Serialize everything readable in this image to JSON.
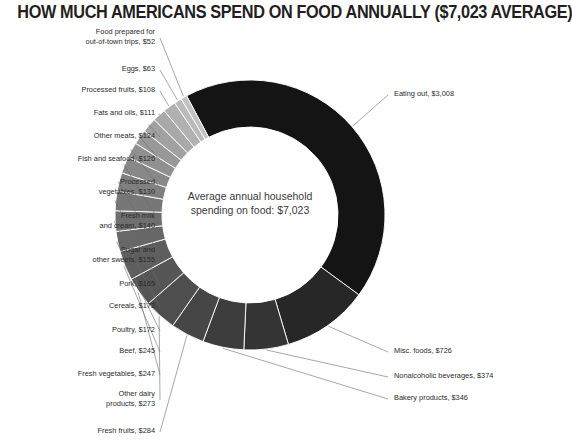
{
  "title": "HOW MUCH AMERICANS SPEND ON FOOD ANNUALLY ($7,023 AVERAGE)",
  "center": {
    "line1": "Average annual household",
    "line2": "spending on food: $7,023"
  },
  "chart_data": {
    "type": "pie",
    "variant": "donut",
    "title": "HOW MUCH AMERICANS SPEND ON FOOD ANNUALLY ($7,023 AVERAGE)",
    "center_label": "Average annual household spending on food: $7,023",
    "total": 7023,
    "currency": "USD",
    "units": "dollars per year",
    "legend": "none (direct labels with leader lines)",
    "start_angle_deg": -118,
    "direction": "clockwise",
    "labels": [
      "Eating out",
      "Misc. foods",
      "Nonalcoholic beverages",
      "Bakery products",
      "Fresh fruits",
      "Other dairy products",
      "Fresh vegetables",
      "Beef",
      "Poultry",
      "Cereals",
      "Pork",
      "Sugar and other sweets",
      "Fresh milk and cream",
      "Processed vegetables",
      "Fish and seafood",
      "Other meats",
      "Fats and oils",
      "Processed fruits",
      "Eggs",
      "Food prepared for out-of-town trips"
    ],
    "values": [
      3008,
      726,
      374,
      346,
      284,
      273,
      247,
      245,
      172,
      172,
      165,
      155,
      140,
      130,
      126,
      124,
      111,
      108,
      63,
      52
    ],
    "value_texts": [
      "$3,008",
      "$726",
      "$374",
      "$346",
      "$284",
      "$273",
      "$247",
      "$245",
      "$172",
      "$172",
      "$165",
      "$155",
      "$140",
      "$130",
      "$126",
      "$124",
      "$111",
      "$108",
      "$63",
      "$52"
    ],
    "colors": [
      "#141414",
      "#272727",
      "#343434",
      "#3d3d3d",
      "#464646",
      "#4e4e4e",
      "#565656",
      "#5e5e5e",
      "#676767",
      "#6f6f6f",
      "#777777",
      "#808080",
      "#888888",
      "#909090",
      "#989898",
      "#a1a1a1",
      "#a9a9a9",
      "#b1b1b1",
      "#bababa",
      "#c2c2c2"
    ]
  },
  "segments": [
    {
      "label": "Eating out, $3,008",
      "name": "eating-out",
      "side": "right",
      "lines": [
        "Eating out, $3,008"
      ]
    },
    {
      "label": "Misc. foods, $726",
      "name": "misc-foods",
      "side": "right",
      "lines": [
        "Misc. foods, $726"
      ]
    },
    {
      "label": "Nonalcoholic beverages, $374",
      "name": "nonalcoholic-beverages",
      "side": "right",
      "lines": [
        "Nonalcoholic beverages, $374"
      ]
    },
    {
      "label": "Bakery products, $346",
      "name": "bakery-products",
      "side": "right",
      "lines": [
        "Bakery products, $346"
      ]
    },
    {
      "label": "Fresh fruits, $284",
      "name": "fresh-fruits",
      "side": "left",
      "lines": [
        "Fresh fruits, $284"
      ]
    },
    {
      "label": "Other dairy products, $273",
      "name": "other-dairy-products",
      "side": "left",
      "lines": [
        "Other dairy",
        "products, $273"
      ]
    },
    {
      "label": "Fresh vegetables, $247",
      "name": "fresh-vegetables",
      "side": "left",
      "lines": [
        "Fresh vegetables, $247"
      ]
    },
    {
      "label": "Beef, $245",
      "name": "beef",
      "side": "left",
      "lines": [
        "Beef, $245"
      ]
    },
    {
      "label": "Poultry, $172",
      "name": "poultry",
      "side": "left",
      "lines": [
        "Poultry, $172"
      ]
    },
    {
      "label": "Cereals, $172",
      "name": "cereals",
      "side": "left",
      "lines": [
        "Cereals, $172"
      ]
    },
    {
      "label": "Pork, $165",
      "name": "pork",
      "side": "left",
      "lines": [
        "Pork, $165"
      ]
    },
    {
      "label": "Sugar and other sweets, $155",
      "name": "sugar-and-other-sweets",
      "side": "left",
      "lines": [
        "Sugar and",
        "other sweets, $155"
      ]
    },
    {
      "label": "Fresh milk and cream, $140",
      "name": "fresh-milk-and-cream",
      "side": "left",
      "lines": [
        "Fresh milk",
        "and cream, $140"
      ]
    },
    {
      "label": "Processed vegetables, $130",
      "name": "processed-vegetables",
      "side": "left",
      "lines": [
        "Processed",
        "vegetables, $130"
      ]
    },
    {
      "label": "Fish and seafood, $126",
      "name": "fish-and-seafood",
      "side": "left",
      "lines": [
        "Fish and seafood, $126"
      ]
    },
    {
      "label": "Other meats, $124",
      "name": "other-meats",
      "side": "left",
      "lines": [
        "Other meats, $124"
      ]
    },
    {
      "label": "Fats and oils, $111",
      "name": "fats-and-oils",
      "side": "left",
      "lines": [
        "Fats and oils, $111"
      ]
    },
    {
      "label": "Processed fruits, $108",
      "name": "processed-fruits",
      "side": "left",
      "lines": [
        "Processed fruits, $108"
      ]
    },
    {
      "label": "Eggs, $63",
      "name": "eggs",
      "side": "left",
      "lines": [
        "Eggs, $63"
      ]
    },
    {
      "label": "Food prepared for out-of-town trips, $52",
      "name": "food-prepared-out-of-town",
      "side": "left",
      "lines": [
        "Food prepared for",
        "out-of-town trips, $52"
      ]
    }
  ]
}
